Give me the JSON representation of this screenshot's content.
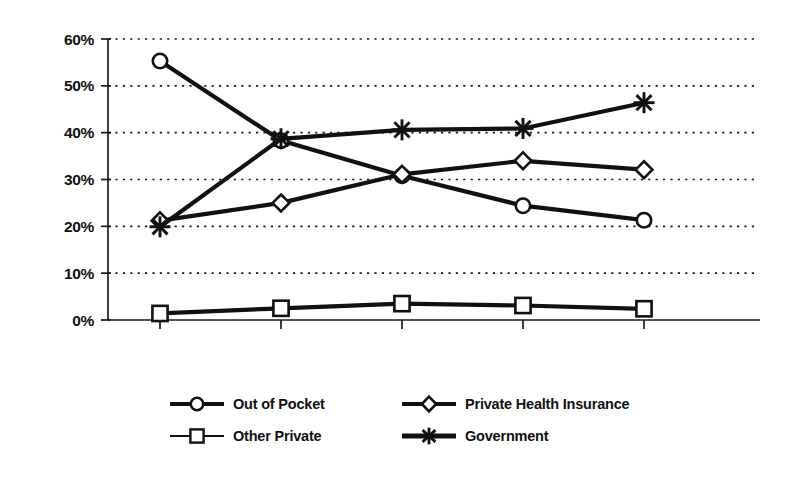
{
  "chart_data": {
    "type": "line",
    "title": "",
    "subtitle": "",
    "xlabel": "",
    "ylabel": "",
    "categories": [
      "1960",
      "1970",
      "1980",
      "1990",
      "1995"
    ],
    "x": [
      1960,
      1970,
      1980,
      1990,
      1995
    ],
    "ylim": [
      0,
      60
    ],
    "ytick_values": [
      0,
      10,
      20,
      30,
      40,
      50,
      60
    ],
    "ytick_labels": [
      "0%",
      "10%",
      "20%",
      "30%",
      "40%",
      "50%",
      "60%"
    ],
    "grid": "horizontal-dotted",
    "legend_position": "bottom",
    "value_format": "percent",
    "series": [
      {
        "name": "Out of Pocket",
        "marker": "circle",
        "values": [
          55.3,
          38.3,
          30.8,
          24.4,
          21.3
        ]
      },
      {
        "name": "Private Health Insurance",
        "marker": "diamond",
        "values": [
          21.2,
          25.0,
          31.1,
          34.0,
          32.1
        ]
      },
      {
        "name": "Other Private",
        "marker": "square",
        "values": [
          1.4,
          2.5,
          3.5,
          3.1,
          2.4
        ]
      },
      {
        "name": "Government",
        "marker": "asterisk",
        "values": [
          19.9,
          38.7,
          40.6,
          40.9,
          46.4
        ]
      }
    ],
    "colors": {
      "line": "#111111",
      "marker_fill": "#ffffff",
      "marker_stroke": "#111111",
      "grid": "#1a1a1a",
      "axis": "#1a1a1a",
      "background": "#ffffff"
    }
  },
  "legend": {
    "items": [
      {
        "label": "Out of Pocket",
        "marker": "circle"
      },
      {
        "label": "Private Health Insurance",
        "marker": "diamond"
      },
      {
        "label": "Other Private",
        "marker": "square"
      },
      {
        "label": "Government",
        "marker": "asterisk"
      }
    ]
  }
}
